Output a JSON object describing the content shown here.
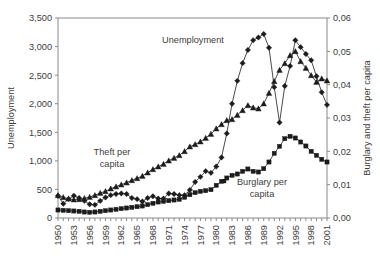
{
  "chart_data": {
    "type": "line",
    "title": "",
    "xlabel": "",
    "ylabel": "Unemployment",
    "y2label": "Burglary and theft per capita",
    "grid": false,
    "legend": "inline-annotations",
    "ylim": [
      0,
      3500
    ],
    "y2lim": [
      0.0,
      0.06
    ],
    "xlim": [
      1950,
      2001
    ],
    "ytick_labels": [
      "0",
      "500",
      "1,000",
      "1,500",
      "2,000",
      "2,500",
      "3,000",
      "3,500"
    ],
    "ytick_values": [
      0,
      500,
      1000,
      1500,
      2000,
      2500,
      3000,
      3500
    ],
    "y2tick_labels": [
      "0,00",
      "0,01",
      "0,02",
      "0,03",
      "0,04",
      "0,05",
      "0,06"
    ],
    "y2tick_values": [
      0.0,
      0.01,
      0.02,
      0.03,
      0.04,
      0.05,
      0.06
    ],
    "xtick_labels": [
      "1950",
      "1953",
      "1956",
      "1959",
      "1962",
      "1965",
      "1968",
      "1971",
      "1974",
      "1977",
      "1980",
      "1983",
      "1986",
      "1989",
      "1992",
      "1995",
      "1998",
      "2001"
    ],
    "xtick_values": [
      1950,
      1953,
      1956,
      1959,
      1962,
      1965,
      1968,
      1971,
      1974,
      1977,
      1980,
      1983,
      1986,
      1989,
      1992,
      1995,
      1998,
      2001
    ],
    "x": [
      1950,
      1951,
      1952,
      1953,
      1954,
      1955,
      1956,
      1957,
      1958,
      1959,
      1960,
      1961,
      1962,
      1963,
      1964,
      1965,
      1966,
      1967,
      1968,
      1969,
      1970,
      1971,
      1972,
      1973,
      1974,
      1975,
      1976,
      1977,
      1978,
      1979,
      1980,
      1981,
      1982,
      1983,
      1984,
      1985,
      1986,
      1987,
      1988,
      1989,
      1990,
      1991,
      1992,
      1993,
      1994,
      1995,
      1996,
      1997,
      1998,
      1999,
      2000,
      2001
    ],
    "series": [
      {
        "name": "Unemployment",
        "axis": "left",
        "marker": "diamond",
        "label_text": "Unemployment",
        "values": [
          390,
          250,
          330,
          390,
          350,
          300,
          240,
          230,
          300,
          360,
          400,
          420,
          430,
          420,
          350,
          330,
          290,
          350,
          380,
          340,
          340,
          430,
          420,
          400,
          400,
          490,
          630,
          720,
          820,
          790,
          900,
          1060,
          1480,
          2000,
          2400,
          2710,
          2940,
          3110,
          3160,
          3220,
          2980,
          2290,
          1670,
          2310,
          2660,
          3110,
          2990,
          2870,
          2760,
          2480,
          2200,
          1980
        ]
      },
      {
        "name": "Theft per capita",
        "axis": "right",
        "marker": "triangle",
        "label_text": "Theft per capita",
        "values": [
          0.0068,
          0.0062,
          0.0058,
          0.0055,
          0.0056,
          0.0059,
          0.0063,
          0.0068,
          0.0075,
          0.008,
          0.0088,
          0.0094,
          0.01,
          0.0106,
          0.0113,
          0.0119,
          0.0126,
          0.0136,
          0.0146,
          0.0154,
          0.0162,
          0.0172,
          0.018,
          0.0188,
          0.02,
          0.0214,
          0.0221,
          0.0229,
          0.024,
          0.0252,
          0.0268,
          0.0281,
          0.0293,
          0.0296,
          0.0309,
          0.0323,
          0.0338,
          0.0331,
          0.0328,
          0.0343,
          0.0375,
          0.041,
          0.0444,
          0.0464,
          0.0488,
          0.05,
          0.047,
          0.045,
          0.0428,
          0.0408,
          0.0418,
          0.0412
        ]
      },
      {
        "name": "Burglary per capita",
        "axis": "right",
        "marker": "square",
        "label_text": "Burglary per capita",
        "values": [
          0.0024,
          0.0023,
          0.0022,
          0.0021,
          0.002,
          0.0018,
          0.0017,
          0.0018,
          0.002,
          0.0022,
          0.0024,
          0.0026,
          0.0028,
          0.003,
          0.0032,
          0.0034,
          0.0036,
          0.004,
          0.0044,
          0.0048,
          0.005,
          0.0052,
          0.0054,
          0.0056,
          0.0062,
          0.007,
          0.0076,
          0.008,
          0.0082,
          0.0085,
          0.0098,
          0.011,
          0.012,
          0.0128,
          0.0132,
          0.014,
          0.0147,
          0.014,
          0.0138,
          0.0148,
          0.0168,
          0.0194,
          0.0215,
          0.0238,
          0.0245,
          0.024,
          0.0228,
          0.0216,
          0.02,
          0.0188,
          0.0176,
          0.0168
        ]
      }
    ]
  }
}
